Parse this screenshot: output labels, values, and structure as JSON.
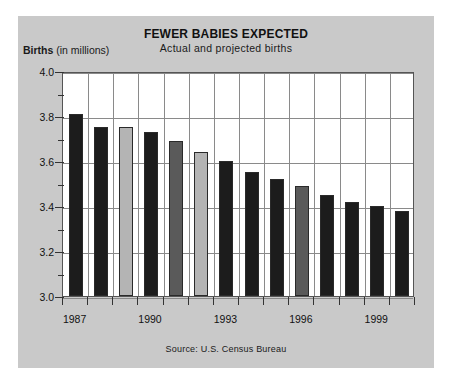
{
  "runhead": {
    "text": ""
  },
  "header": {
    "title": "FEWER BABIES EXPECTED",
    "subtitle": "Actual and projected births",
    "y_axis_label_bold": "Births",
    "y_axis_label_rest": " (in millions)"
  },
  "footer": {
    "source": "Source: U.S. Census Bureau"
  },
  "colors": {
    "panel_background": "#c9c9c9",
    "plot_background": "#ffffff",
    "gridline": "#8a8a8a",
    "bar_dark": "#1c1c1c",
    "bar_light": "#b4b4b4",
    "bar_mid": "#5a5a5a",
    "text": "#111111"
  },
  "chart_data": {
    "type": "bar",
    "title": "FEWER BABIES EXPECTED",
    "subtitle": "Actual and projected births",
    "xlabel": "",
    "ylabel": "Births (in millions)",
    "ylim": [
      3.0,
      4.0
    ],
    "ytick_labels": [
      "4.0",
      "3.8",
      "3.6",
      "3.4",
      "3.2",
      "3.0"
    ],
    "ytick_values": [
      4.0,
      3.8,
      3.6,
      3.4,
      3.2,
      3.0
    ],
    "minor_tick_step": 0.1,
    "grid": true,
    "legend": "none",
    "source": "Source: U.S. Census Bureau",
    "xtick_labels": [
      "1987",
      "1990",
      "1993",
      "1996",
      "1999"
    ],
    "categories": [
      "1987",
      "1988",
      "1989",
      "1990",
      "1991",
      "1992",
      "1993",
      "1994",
      "1995",
      "1996",
      "1997",
      "1998",
      "1999",
      "2000"
    ],
    "values": [
      3.81,
      3.75,
      3.75,
      3.73,
      3.69,
      3.64,
      3.6,
      3.55,
      3.52,
      3.49,
      3.45,
      3.42,
      3.4,
      3.38
    ],
    "bar_shades": [
      "dark",
      "dark",
      "light",
      "dark",
      "mid",
      "light",
      "dark",
      "dark",
      "dark",
      "mid",
      "dark",
      "dark",
      "dark",
      "dark"
    ]
  }
}
